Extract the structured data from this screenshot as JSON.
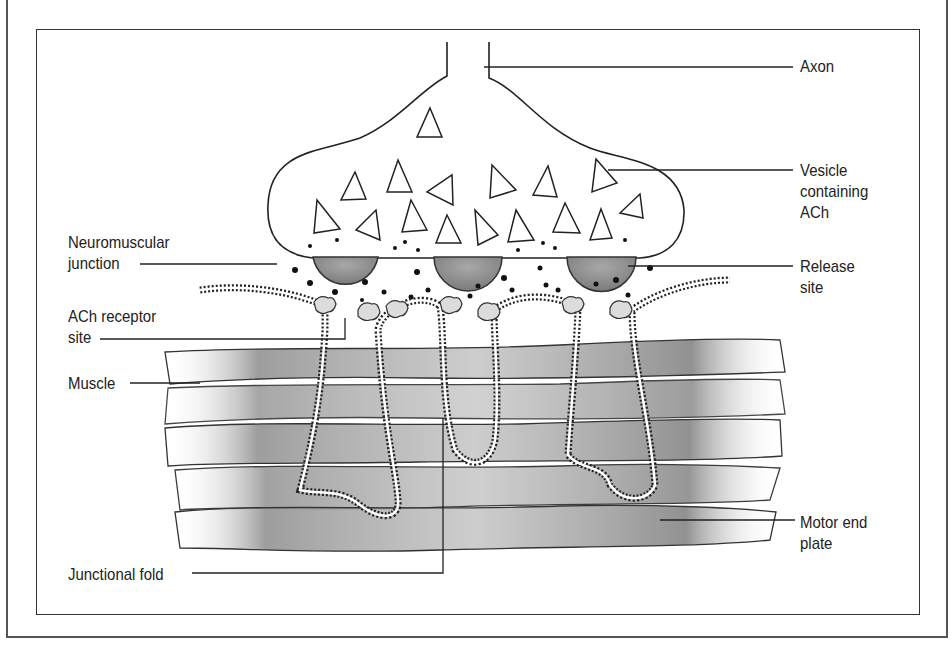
{
  "diagram": {
    "title": "Neuromuscular junction",
    "labels": {
      "axon": "Axon",
      "vesicle": "Vesicle\ncontaining\nACh",
      "release_site": "Release\nsite",
      "neuromuscular_junction": "Neuromuscular\njunction",
      "ach_receptor_site": "ACh receptor\nsite",
      "muscle": "Muscle",
      "motor_end_plate": "Motor end\nplate",
      "junctional_fold": "Junctional fold"
    },
    "colors": {
      "line": "#222222",
      "release_site_fill": "#8a8a8a",
      "muscle_shade": "#9a9a9a",
      "receptor_fill": "#dcdcdc",
      "frame": "#444444"
    },
    "counts": {
      "vesicles": 17,
      "release_sites": 3,
      "receptors": 8,
      "junctional_folds": 3
    }
  }
}
